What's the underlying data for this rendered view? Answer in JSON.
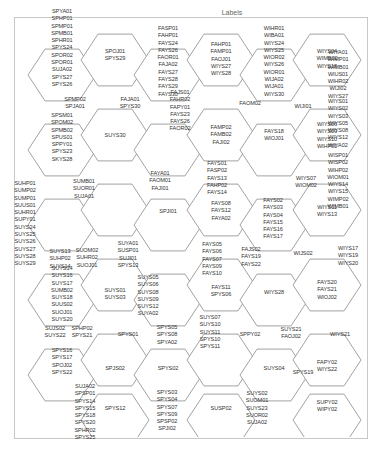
{
  "title": "Labels",
  "hex": {
    "stroke": "#8a8a8a",
    "fill": "#ffffff",
    "r": 34
  },
  "cells": [
    {
      "cx": 62,
      "cy": 75,
      "labels": [
        "SPYA01",
        "SPHP01",
        "SPMP01",
        "SPMB01",
        "SPHR01",
        "SPYS24",
        "SPOR02",
        "SPOR01",
        "SUJA02",
        "SPYS27",
        "SPYS26"
      ],
      "ty": 11
    },
    {
      "cx": 115,
      "cy": 60,
      "labels": [
        "SPOJ01",
        "SPYS29"
      ],
      "ty": 51
    },
    {
      "cx": 168,
      "cy": 75,
      "labels": [
        "FASP01",
        "FAHP01",
        "FAYS24",
        "FAYS26",
        "FAOR01",
        "FAJA02",
        "FAYS27",
        "FAYS28",
        "FAYS29",
        "FAYS30"
      ],
      "ty": 28
    },
    {
      "cx": 221,
      "cy": 60,
      "labels": [
        "FAHP01",
        "FAMP01",
        "FAOJ01",
        "WIYS27",
        "WIYS28"
      ],
      "ty": 44
    },
    {
      "cx": 274,
      "cy": 75,
      "labels": [
        "WIHR01",
        "WIBA01",
        "WIYS24",
        "WIYS25",
        "WIOR02",
        "WIYS26",
        "WIOR01",
        "WIJA02",
        "WIJA01",
        "WIYS30"
      ],
      "ty": 28
    },
    {
      "cx": 327,
      "cy": 60,
      "labels": [
        "WIYS04",
        "WIMB02",
        "WIYS18"
      ],
      "ty": 51
    },
    {
      "cx": 62,
      "cy": 150,
      "labels": [
        "SPSM01",
        "SPOM02",
        "SPMB02",
        "SPUS01",
        "SPPY01",
        "SPYS23",
        "SKYS28"
      ],
      "ty": 115
    },
    {
      "cx": 115,
      "cy": 135,
      "labels": [
        "SUYS30"
      ],
      "ty": 135
    },
    {
      "cx": 168,
      "cy": 150,
      "labels": [],
      "ty": 150
    },
    {
      "cx": 221,
      "cy": 135,
      "labels": [
        "FAMP02",
        "FAMB02",
        "FAJI02"
      ],
      "ty": 127
    },
    {
      "cx": 274,
      "cy": 150,
      "labels": [
        "FAYS18",
        "WIOJ01"
      ],
      "ty": 131
    },
    {
      "cx": 327,
      "cy": 135,
      "labels": [
        "WIYS06",
        "WIYS09",
        "WIYS10",
        "WIHP01"
      ],
      "ty": 124
    },
    {
      "cx": 62,
      "cy": 225,
      "labels": [],
      "ty": 225
    },
    {
      "cx": 115,
      "cy": 210,
      "labels": [],
      "ty": 210
    },
    {
      "cx": 168,
      "cy": 225,
      "labels": [
        "SPJI01"
      ],
      "ty": 211
    },
    {
      "cx": 221,
      "cy": 210,
      "labels": [
        "FAYS08",
        "FAYS12",
        "FAYA02"
      ],
      "ty": 203
    },
    {
      "cx": 274,
      "cy": 225,
      "labels": [],
      "ty": 225
    },
    {
      "cx": 327,
      "cy": 210,
      "labels": [
        "WIYS11",
        "WIYS13"
      ],
      "ty": 207
    },
    {
      "cx": 62,
      "cy": 300,
      "labels": [
        "SUYS14",
        "SUYS16",
        "SUYS17",
        "SUMB02",
        "SUYS18",
        "SUUS02",
        "SUOJ01",
        "SUYS20"
      ],
      "ty": 268
    },
    {
      "cx": 115,
      "cy": 285,
      "labels": [
        "SUYS01",
        "SUYS03"
      ],
      "ty": 290
    },
    {
      "cx": 168,
      "cy": 300,
      "labels": [],
      "ty": 300
    },
    {
      "cx": 221,
      "cy": 285,
      "labels": [
        "FAYS11",
        "SPYS06"
      ],
      "ty": 287
    },
    {
      "cx": 274,
      "cy": 300,
      "labels": [
        "WIYS28"
      ],
      "ty": 292
    },
    {
      "cx": 327,
      "cy": 285,
      "labels": [
        "FAYS20",
        "FAYS21",
        "WIOJ02"
      ],
      "ty": 282
    },
    {
      "cx": 62,
      "cy": 375,
      "labels": [
        "SPYS16",
        "SPYS17",
        "SPOJ02",
        "SPYS22"
      ],
      "ty": 350
    },
    {
      "cx": 115,
      "cy": 360,
      "labels": [
        "SPJS02"
      ],
      "ty": 368
    },
    {
      "cx": 168,
      "cy": 375,
      "labels": [
        "SPYS02"
      ],
      "ty": 368
    },
    {
      "cx": 221,
      "cy": 360,
      "labels": [],
      "ty": 360
    },
    {
      "cx": 274,
      "cy": 375,
      "labels": [
        "SUYS04"
      ],
      "ty": 368
    },
    {
      "cx": 327,
      "cy": 360,
      "labels": [
        "FAPY02",
        "WIYS22"
      ],
      "ty": 362
    },
    {
      "cx": 115,
      "cy": 420,
      "labels": [
        "SPYS12"
      ],
      "ty": 408
    },
    {
      "cx": 221,
      "cy": 420,
      "labels": [
        "SUSP02"
      ],
      "ty": 408
    },
    {
      "cx": 327,
      "cy": 420,
      "labels": [
        "SUPY02",
        "WIPY02"
      ],
      "ty": 402
    }
  ],
  "free_labels": [
    {
      "x": 75,
      "y": 96,
      "labels": [
        "SPMP02",
        "SPJA01"
      ]
    },
    {
      "x": 130,
      "y": 96,
      "labels": [
        "FAJA01",
        "SPYS30"
      ]
    },
    {
      "x": 180,
      "y": 89,
      "labels": [
        "FAJS01",
        "FAHR02",
        "FAPY01",
        "FAYS23",
        "FAYS26",
        "FAOR02"
      ]
    },
    {
      "x": 250,
      "y": 100,
      "labels": [
        "FAOM02"
      ]
    },
    {
      "x": 303,
      "y": 103,
      "labels": [
        "WIJI01"
      ]
    },
    {
      "x": 338,
      "y": 49,
      "labels": [
        "WIYA01",
        "WIMP01",
        "WIMB01",
        "WIUS01",
        "WIHR02",
        "WIJI02",
        "WIYS27"
      ]
    },
    {
      "x": 338,
      "y": 98,
      "labels": [
        "WIYS01",
        "WIYS02",
        "WIYS03",
        "WIYS05",
        "WIYS08",
        "WIYS12",
        "WIYA02"
      ]
    },
    {
      "x": 338,
      "y": 152,
      "labels": [
        "WISP01",
        "WISP02",
        "WIHP02",
        "WIOM01",
        "WIYS14",
        "WIYS15",
        "WIMP02",
        "WIMB01"
      ]
    },
    {
      "x": 306,
      "y": 175,
      "labels": [
        "WIYS07",
        "WIOM02"
      ]
    },
    {
      "x": 25,
      "y": 180,
      "labels": [
        "SUHP01",
        "SUMP02",
        "SUMP01",
        "SUUS01",
        "SUHR01",
        "SUPY01",
        "SUYS24",
        "SUYS25",
        "SUYS26",
        "SUYS27",
        "SUYS28",
        "SUYS29"
      ]
    },
    {
      "x": 84,
      "y": 178,
      "labels": [
        "SUMB01",
        "SUOR01",
        "SUJA01"
      ]
    },
    {
      "x": 160,
      "y": 170,
      "labels": [
        "FAYA01",
        "FAOM01",
        "FAJI01"
      ]
    },
    {
      "x": 217,
      "y": 160,
      "labels": [
        "FAYS01",
        "FASP02",
        "FAYS13",
        "FAHP02",
        "FAYS14"
      ]
    },
    {
      "x": 273,
      "y": 197,
      "labels": [
        "FAYS02",
        "FAYS03",
        "FAYS04",
        "FAYS15",
        "FAYS16",
        "FAYS17"
      ]
    },
    {
      "x": 343,
      "y": 200,
      "labels": [
        " "
      ]
    },
    {
      "x": 60,
      "y": 248,
      "labels": [
        "SUYS13",
        "SUHP02",
        "SUYS14"
      ]
    },
    {
      "x": 87,
      "y": 247,
      "labels": [
        "SUOM02",
        "SUHR02",
        "SUOJ01"
      ]
    },
    {
      "x": 128,
      "y": 240,
      "labels": [
        "SUYA01",
        "SUSP01",
        "SUJI01",
        "SPYS13"
      ]
    },
    {
      "x": 148,
      "y": 274,
      "labels": [
        "SUYS05",
        "SUYS06",
        "SUYS08",
        "SUYS09",
        "SUYS12",
        "SUYA02"
      ]
    },
    {
      "x": 212,
      "y": 241,
      "labels": [
        "FAYS05",
        "FAYS06",
        "FAYS07",
        "FAYS09",
        "FAYS10"
      ]
    },
    {
      "x": 251,
      "y": 246,
      "labels": [
        "FAJS02",
        "FAYS19",
        "FAYS22"
      ]
    },
    {
      "x": 303,
      "y": 250,
      "labels": [
        "WIJS02"
      ]
    },
    {
      "x": 348,
      "y": 245,
      "labels": [
        "WIYS17",
        "WIYS19",
        "WIYS20"
      ]
    },
    {
      "x": 55,
      "y": 325,
      "labels": [
        "SUJS02",
        "SUYS22"
      ]
    },
    {
      "x": 82,
      "y": 325,
      "labels": [
        "SPHP02",
        "SPYS21"
      ]
    },
    {
      "x": 128,
      "y": 331,
      "labels": [
        "SPYS01"
      ]
    },
    {
      "x": 167,
      "y": 324,
      "labels": [
        "SPYS05",
        "SPYS08",
        "SPYA02"
      ]
    },
    {
      "x": 210,
      "y": 314,
      "labels": [
        "SUYS07",
        "SUYS10",
        "SUYS11",
        "SPYS10",
        "SPYS11"
      ]
    },
    {
      "x": 250,
      "y": 331,
      "labels": [
        "SPPY02"
      ]
    },
    {
      "x": 291,
      "y": 326,
      "labels": [
        "SUYS21",
        "FAOJ02"
      ]
    },
    {
      "x": 340,
      "y": 331,
      "labels": [
        "WIYS21"
      ]
    },
    {
      "x": 303,
      "y": 369,
      "labels": [
        "SPYS19"
      ]
    },
    {
      "x": 85,
      "y": 383,
      "labels": [
        "SUJA02",
        "SPSP01",
        "SPYS14",
        "SPYS15",
        "SPYS18",
        "SPYS20",
        "SPHR02",
        "SPYS25"
      ]
    },
    {
      "x": 167,
      "y": 389,
      "labels": [
        "SPYS03",
        "SPYS04",
        "SPYS07",
        "SPYS09",
        "SPSP02",
        "SPJI02"
      ]
    },
    {
      "x": 257,
      "y": 390,
      "labels": [
        "SUYS02",
        "SUOM01",
        "SUYS23",
        "SUOR02",
        "SUJA02"
      ]
    }
  ]
}
